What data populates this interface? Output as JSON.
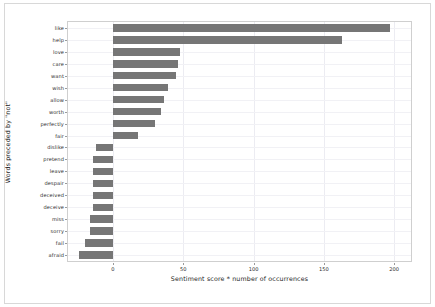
{
  "chart_data": {
    "type": "bar",
    "orientation": "horizontal",
    "title": "",
    "xlabel": "Sentiment score * number of occurrences",
    "ylabel": "Words preceded by \"not\"",
    "categories": [
      "like",
      "help",
      "love",
      "care",
      "want",
      "wish",
      "allow",
      "worth",
      "perfectly",
      "fair",
      "dislike",
      "pretend",
      "leave",
      "despair",
      "deceived",
      "deceive",
      "miss",
      "sorry",
      "fail",
      "afraid"
    ],
    "values": [
      197,
      163,
      48,
      46,
      45,
      39,
      36,
      34,
      30,
      18,
      -12,
      -14,
      -14,
      -14,
      -14,
      -14,
      -16,
      -16,
      -20,
      -24
    ],
    "xticks": [
      0,
      50,
      100,
      150,
      200
    ],
    "xticklabels": [
      "0",
      "50",
      "100",
      "150",
      "200"
    ],
    "xlim": [
      -32,
      212
    ],
    "grid": true,
    "grid_axis": "both",
    "legend": null,
    "bar_color": "#767676",
    "background_color": "#ffffff",
    "frame_color": "#d8d8d8",
    "axes_color": "#cfcfcf",
    "gridline_color": "#ececf2"
  }
}
